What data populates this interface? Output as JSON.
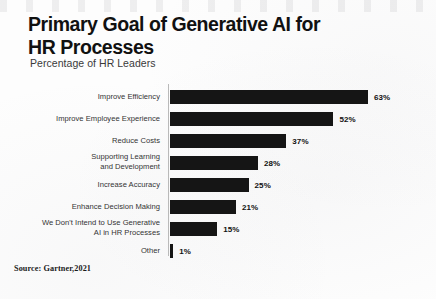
{
  "chart_data": {
    "type": "bar",
    "orientation": "horizontal",
    "title": "Primary Goal of Generative AI for HR Processes",
    "subtitle": "Percentage of HR Leaders",
    "xlabel": "",
    "ylabel": "",
    "xlim": [
      0,
      63
    ],
    "grid": false,
    "legend": false,
    "source": "Source: Gartner,2021",
    "bar_color": "#151515",
    "categories": [
      "Improve Efficiency",
      "Improve Employee Experience",
      "Reduce Costs",
      "Supporting Learning and Development",
      "Increase Accuracy",
      "Enhance Decision Making",
      "We Don't Intend to Use Generative AI in HR Processes",
      "Other"
    ],
    "values": [
      63,
      52,
      37,
      28,
      25,
      21,
      15,
      1
    ],
    "value_labels": [
      "63%",
      "52%",
      "37%",
      "28%",
      "25%",
      "21%",
      "15%",
      "1%"
    ],
    "bars": [
      {
        "label_line1": "Improve Efficiency",
        "label_line2": "",
        "value": 63,
        "value_label": "63%"
      },
      {
        "label_line1": "Improve Employee Experience",
        "label_line2": "",
        "value": 52,
        "value_label": "52%"
      },
      {
        "label_line1": "Reduce Costs",
        "label_line2": "",
        "value": 37,
        "value_label": "37%"
      },
      {
        "label_line1": "Supporting Learning",
        "label_line2": "and Development",
        "value": 28,
        "value_label": "28%"
      },
      {
        "label_line1": "Increase Accuracy",
        "label_line2": "",
        "value": 25,
        "value_label": "25%"
      },
      {
        "label_line1": "Enhance Decision Making",
        "label_line2": "",
        "value": 21,
        "value_label": "21%"
      },
      {
        "label_line1": "We Don't Intend to Use Generative",
        "label_line2": "AI in HR Processes",
        "value": 15,
        "value_label": "15%"
      },
      {
        "label_line1": "Other",
        "label_line2": "",
        "value": 1,
        "value_label": "1%"
      }
    ]
  },
  "title_lines": {
    "line1": "Primary Goal of Generative AI for",
    "line2": "HR Processes"
  }
}
